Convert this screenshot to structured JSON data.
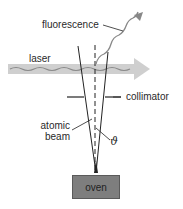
{
  "diagram": {
    "labels": {
      "fluorescence": "fluorescence",
      "laser": "laser",
      "collimator": "collimator",
      "atomic_beam_line1": "atomic",
      "atomic_beam_line2": "beam",
      "angle": "ϑ",
      "oven": "oven"
    },
    "colors": {
      "laser_beam": "#c8c8c8",
      "laser_wave": "#8a8a8a",
      "oven_fill": "#7e7e7e",
      "lines": "#222222",
      "background": "#ffffff"
    },
    "elements": [
      "oven",
      "atomic beam cone",
      "beam axis (dashed)",
      "collimator slits",
      "laser beam arrow",
      "fluorescence wavy arrow",
      "angle theta"
    ]
  }
}
